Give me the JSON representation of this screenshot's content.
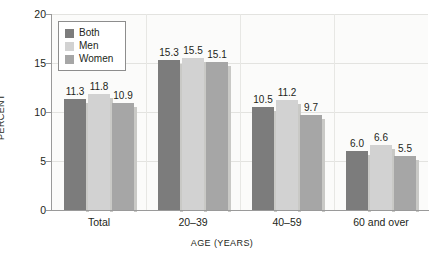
{
  "chart_data": {
    "type": "bar",
    "title": "",
    "subtitle": "",
    "xlabel": "AGE (YEARS)",
    "ylabel": "PERCENT",
    "categories": [
      "Total",
      "20–39",
      "40–59",
      "60 and over"
    ],
    "series": [
      {
        "name": "Both",
        "color": "#7c7c7c",
        "values": [
          11.3,
          15.3,
          10.5,
          6.0
        ]
      },
      {
        "name": "Men",
        "color": "#d2d2d2",
        "values": [
          11.8,
          15.5,
          11.2,
          6.6
        ]
      },
      {
        "name": "Women",
        "color": "#a6a6a6",
        "values": [
          10.9,
          15.1,
          9.7,
          5.5
        ]
      }
    ],
    "ylim": [
      0,
      20
    ],
    "yticks": [
      "0",
      "5",
      "10",
      "15",
      "20"
    ],
    "ytick_values": [
      0,
      5,
      10,
      15,
      20
    ],
    "grid": "horizontal-and-group-separators",
    "legend_position": "top-left-inside",
    "data_labels": [
      [
        "11.3",
        "11.8",
        "10.9"
      ],
      [
        "15.3",
        "15.5",
        "15.1"
      ],
      [
        "10.5",
        "11.2",
        "9.7"
      ],
      [
        "6.0",
        "6.6",
        "5.5"
      ]
    ]
  },
  "legend": {
    "items": [
      {
        "label": "Both"
      },
      {
        "label": "Men"
      },
      {
        "label": "Women"
      }
    ]
  },
  "colors": {
    "both": "#7c7c7c",
    "men": "#d2d2d2",
    "women": "#a6a6a6",
    "axis": "#9a9a9a",
    "grid": "#e3e3e0",
    "plot_background": "#fbfbfa",
    "text": "#231f20"
  }
}
